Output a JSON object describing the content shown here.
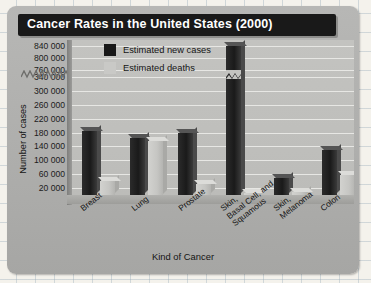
{
  "chart_data": {
    "type": "bar",
    "title": "Cancer Rates in the United States (2000)",
    "xlabel": "Kind of Cancer",
    "ylabel": "Number of cases",
    "grid": true,
    "legend_position": "top-left",
    "axis_note": "y-axis has a break between 340 000 and 760 000",
    "categories": [
      "Breast",
      "Lung",
      "Prostate",
      "Skin,\nBasal Cell, and\nSquamous",
      "Skin,\nMelanoma",
      "Colon"
    ],
    "ytick_labels": [
      "840 000",
      "800 000",
      "760 000",
      "340 000",
      "300 000",
      "260 000",
      "220 000",
      "180 000",
      "140 000",
      "100 000",
      "60 000",
      "20 000"
    ],
    "series": [
      {
        "name": "Estimated new cases",
        "color": "#181818",
        "values": [
          185000,
          165000,
          180000,
          840000,
          48000,
          130000
        ]
      },
      {
        "name": "Estimated deaths",
        "color": "#c9c9c6",
        "values": [
          41000,
          157000,
          32000,
          2000,
          7700,
          57000
        ]
      }
    ]
  },
  "header": {
    "title": "Cancer Rates in the United States (2000)"
  },
  "legend": {
    "items": [
      {
        "label": "Estimated new cases"
      },
      {
        "label": "Estimated deaths"
      }
    ]
  },
  "axes": {
    "y_title": "Number of cases",
    "x_title": "Kind of Cancer"
  }
}
